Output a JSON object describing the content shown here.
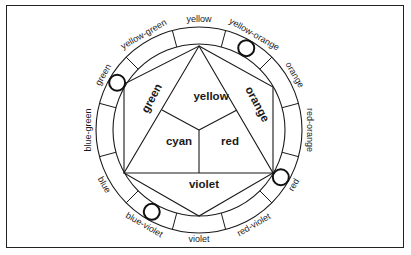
{
  "diagram": {
    "type": "color-wheel",
    "center": [
      199,
      130
    ],
    "inner_radius": 86,
    "outer_radius": 103,
    "stroke_color": "#1a1a1a",
    "ring_labels": [
      {
        "label": "yellow",
        "angle": -90
      },
      {
        "label": "yellow-orange",
        "angle": -60
      },
      {
        "label": "orange",
        "angle": -30
      },
      {
        "label": "red-orange",
        "angle": 0
      },
      {
        "label": "red",
        "angle": 30
      },
      {
        "label": "red-violet",
        "angle": 60
      },
      {
        "label": "violet",
        "angle": 90
      },
      {
        "label": "blue-violet",
        "angle": 120
      },
      {
        "label": "blue",
        "angle": 150
      },
      {
        "label": "blue-green",
        "angle": 180
      },
      {
        "label": "green",
        "angle": 210
      },
      {
        "label": "yellow-green",
        "angle": 240
      }
    ],
    "marked_segments": [
      "yellow-orange",
      "red",
      "blue-violet",
      "green"
    ],
    "inner_labels": {
      "yellow": "yellow",
      "cyan": "cyan",
      "red": "red",
      "green": "green",
      "orange": "orange",
      "violet": "violet"
    }
  }
}
